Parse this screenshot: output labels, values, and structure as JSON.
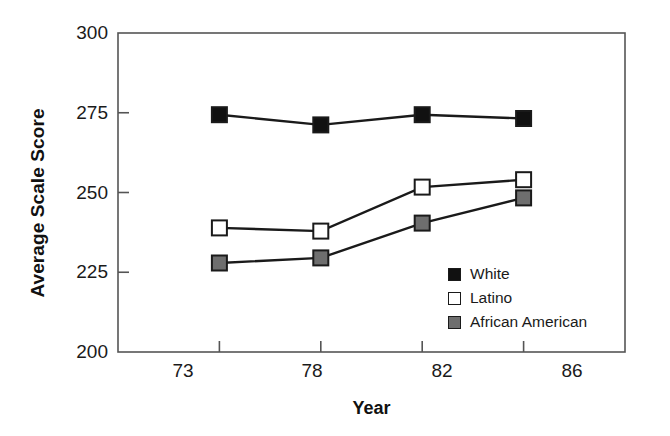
{
  "chart_data": {
    "type": "line",
    "title": "",
    "xlabel": "Year",
    "ylabel": "Average Scale Score",
    "categories": [
      "73",
      "78",
      "82",
      "86"
    ],
    "ylim": [
      200,
      300
    ],
    "yticks": [
      200,
      225,
      250,
      275,
      300
    ],
    "ytick_labels": [
      "200",
      "225",
      "250",
      "275",
      "300"
    ],
    "grid": false,
    "legend_position": "inside-lower-right",
    "series": [
      {
        "name": "White",
        "marker": "filled-square",
        "color": "#111111",
        "values": [
          274.4,
          271.2,
          274.4,
          273.2
        ]
      },
      {
        "name": "Latino",
        "marker": "open-square",
        "color": "#ffffff",
        "values": [
          238.9,
          237.9,
          251.7,
          254.0
        ]
      },
      {
        "name": "African American",
        "marker": "gray-square",
        "color": "#6e6e6e",
        "values": [
          227.9,
          229.5,
          240.4,
          248.3
        ]
      }
    ]
  },
  "axes": {
    "y_label": "Average Scale Score",
    "x_label": "Year",
    "y_tick_0": "200",
    "y_tick_1": "225",
    "y_tick_2": "250",
    "y_tick_3": "275",
    "y_tick_4": "300",
    "x_tick_0": "73",
    "x_tick_1": "78",
    "x_tick_2": "82",
    "x_tick_3": "86"
  },
  "legend": {
    "items": [
      {
        "label": "White"
      },
      {
        "label": "Latino"
      },
      {
        "label": "African American"
      }
    ]
  },
  "colors": {
    "line": "#1a1a1a",
    "axis": "#555555",
    "white_series": "#111111",
    "latino_series": "#ffffff",
    "african_american_series": "#6e6e6e"
  }
}
